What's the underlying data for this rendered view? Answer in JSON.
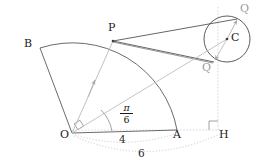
{
  "figure": {
    "type": "geometry-diagram",
    "width": 266,
    "height": 167,
    "background_color": "#ffffff"
  },
  "colors": {
    "stroke_dark": "#3c3c3c",
    "stroke_medium": "#6e6e6e",
    "stroke_light_gray": "#b9b9b9",
    "stroke_dotted": "#c2c2c2",
    "label_dark": "#1a1a1a",
    "label_gray": "#9a9a9a"
  },
  "points": [
    {
      "name": "O",
      "label": "O",
      "x": 72,
      "y": 133,
      "label_x": 60,
      "label_y": 134,
      "color": "dark",
      "dot": false
    },
    {
      "name": "A",
      "label": "A",
      "x": 177,
      "y": 130,
      "label_x": 173,
      "label_y": 134,
      "color": "dark",
      "dot": false
    },
    {
      "name": "H",
      "label": "H",
      "x": 218,
      "y": 130,
      "label_x": 219,
      "label_y": 134,
      "color": "dark",
      "dot": false
    },
    {
      "name": "B",
      "label": "B",
      "x": 40,
      "y": 48,
      "label_x": 25,
      "label_y": 43,
      "color": "dark",
      "dot": false
    },
    {
      "name": "P",
      "label": "P",
      "x": 113,
      "y": 40,
      "label_x": 108,
      "label_y": 25,
      "color": "dark",
      "dot": true
    },
    {
      "name": "C",
      "label": "C",
      "x": 227,
      "y": 39,
      "label_x": 232,
      "label_y": 35,
      "color": "dark",
      "dot": true
    },
    {
      "name": "Q1",
      "label": "Q",
      "x": 237,
      "y": 19,
      "label_x": 240,
      "label_y": 8,
      "color": "gray",
      "dot": false
    },
    {
      "name": "Q2",
      "label": "Q",
      "x": 214,
      "y": 62,
      "label_x": 203,
      "label_y": 66,
      "color": "gray",
      "dot": false
    }
  ],
  "angle_label": {
    "numerator": "π",
    "denominator": "6",
    "x": 126,
    "y": 110,
    "description": "angle AOP equals pi over six"
  },
  "measurements": [
    {
      "name": "segment-OA",
      "label": "4",
      "from": "O",
      "to": "A",
      "label_x": 121,
      "label_y": 138,
      "style": "dotted-arc"
    },
    {
      "name": "segment-OH",
      "label": "6",
      "from": "O",
      "to": "H",
      "label_x": 140,
      "label_y": 152,
      "style": "dotted-arc"
    }
  ],
  "right_angles": [
    {
      "name": "right-angle-at-O",
      "at": "O",
      "between": "OB and OP"
    },
    {
      "name": "right-angle-at-H",
      "at": "H",
      "between": "OH and HC"
    }
  ],
  "segments": [
    {
      "name": "segment-OB",
      "from": "O",
      "to": "B",
      "style": "solid"
    },
    {
      "name": "segment-OA",
      "from": "O",
      "to": "A",
      "style": "solid"
    },
    {
      "name": "segment-AH",
      "from": "A",
      "to": "H",
      "style": "dotted"
    },
    {
      "name": "segment-PQ1",
      "from": "P",
      "to": "Q1",
      "style": "solid"
    },
    {
      "name": "segment-PQ2",
      "from": "P",
      "to": "Q2",
      "style": "solid"
    },
    {
      "name": "vector-OP",
      "from": "O",
      "to": "P",
      "style": "arrow-gray"
    },
    {
      "name": "vector-OC",
      "from": "O",
      "to": "C",
      "style": "arrow-gray"
    },
    {
      "name": "vector-CQ1",
      "from": "C",
      "to": "Q1",
      "style": "arrow-gray"
    },
    {
      "name": "vector-CQ2",
      "from": "C",
      "to": "Q2",
      "style": "arrow-gray"
    },
    {
      "name": "vertical-HC",
      "from": "H",
      "to": "Q1",
      "style": "dotted-vertical"
    }
  ],
  "arcs": [
    {
      "name": "sector-arc-BA",
      "center": "O",
      "from": "B",
      "to": "A",
      "style": "solid"
    }
  ],
  "circle": {
    "name": "circle-C",
    "center": "C",
    "cx": 227,
    "cy": 39,
    "r": 23,
    "style": "solid"
  }
}
